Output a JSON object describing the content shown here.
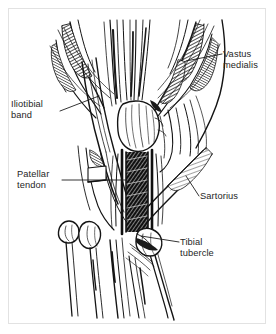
{
  "figure": {
    "background_color": "#ffffff",
    "ink_color": "#1a1a1a",
    "frame_color": "#e2e2e2",
    "text_color": "#262626"
  },
  "labels": {
    "vastus_medialis": {
      "line1": "Vastus",
      "line2": "medialis"
    },
    "iliotibial_band": {
      "line1": "Iliotibial",
      "line2": "band"
    },
    "patellar_tendon": {
      "line1": "Patellar",
      "line2": "tendon"
    },
    "sartorius": {
      "line1": "Sartorius"
    },
    "tibial_tubercle": {
      "line1": "Tibial",
      "line2": "tubercle"
    }
  },
  "leader_lines": {
    "vastus_medialis": {
      "from_x": 222,
      "from_y": 54,
      "to_x": 186,
      "to_y": 61
    },
    "iliotibial_band": {
      "from_x": 60,
      "from_y": 111,
      "to_x": 99,
      "to_y": 96
    },
    "patellar_tendon": {
      "from_x": 62,
      "from_y": 180,
      "to_x": 127,
      "to_y": 180
    },
    "sartorius": {
      "from_x": 199,
      "from_y": 196,
      "to_x": 186,
      "to_y": 176
    },
    "tibial_tubercle": {
      "from_x": 179,
      "from_y": 242,
      "to_x": 141,
      "to_y": 236
    }
  }
}
